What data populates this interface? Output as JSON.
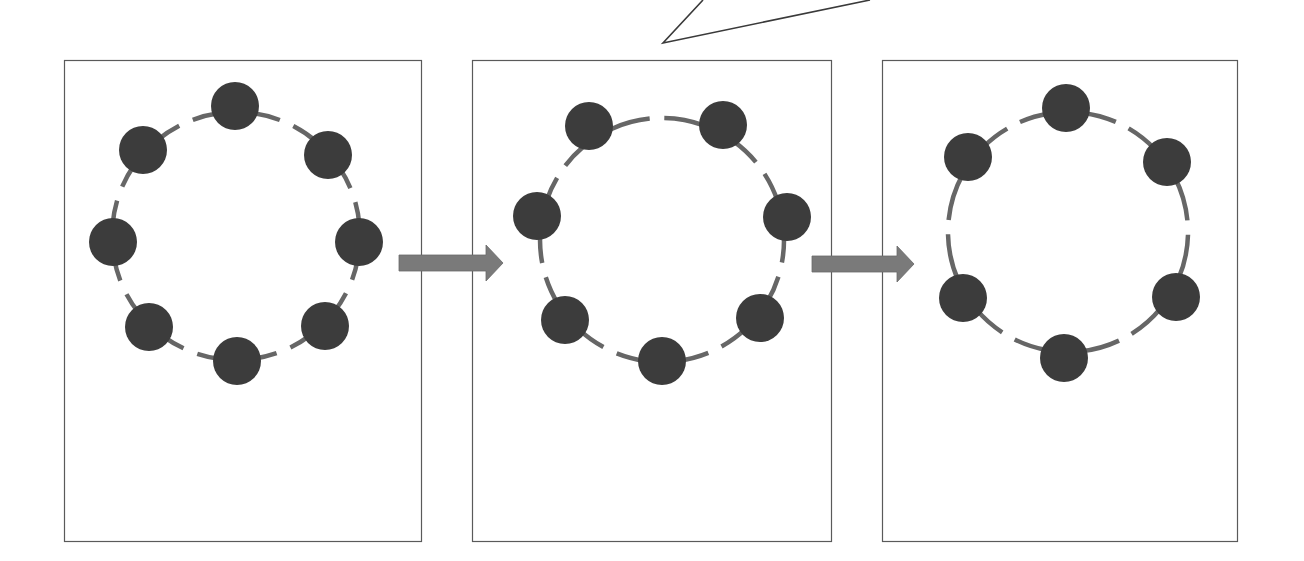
{
  "diagram": {
    "title": "",
    "colors": {
      "background": "#ffffff",
      "panel_border": "#5a5a5a",
      "bead_fill": "#3c3c3c",
      "ring_dash": "#666666",
      "arrow_fill": "#7a7a7a",
      "callout_stroke": "#3a3a3a"
    },
    "callout_pointer": {
      "tip": [
        663,
        43
      ],
      "left_end": [
        703,
        0
      ],
      "right_end": [
        870,
        0
      ]
    },
    "panels": [
      {
        "id": "panel-1",
        "bead_count": 8,
        "box": {
          "x": 64,
          "y": 60,
          "w": 357,
          "h": 481
        },
        "ring": {
          "cx": 236,
          "cy": 236,
          "r": 124
        },
        "beads": [
          [
            235,
            106
          ],
          [
            328,
            155
          ],
          [
            359,
            242
          ],
          [
            325,
            326
          ],
          [
            237,
            361
          ],
          [
            149,
            327
          ],
          [
            113,
            242
          ],
          [
            143,
            150
          ]
        ]
      },
      {
        "id": "panel-2",
        "bead_count": 7,
        "box": {
          "x": 472,
          "y": 60,
          "w": 359,
          "h": 481
        },
        "ring": {
          "cx": 662,
          "cy": 240,
          "r": 122
        },
        "beads": [
          [
            589,
            126
          ],
          [
            723,
            125
          ],
          [
            787,
            217
          ],
          [
            760,
            318
          ],
          [
            662,
            361
          ],
          [
            565,
            320
          ],
          [
            537,
            216
          ]
        ]
      },
      {
        "id": "panel-3",
        "bead_count": 6,
        "box": {
          "x": 882,
          "y": 60,
          "w": 355,
          "h": 481
        },
        "ring": {
          "cx": 1068,
          "cy": 232,
          "r": 120
        },
        "beads": [
          [
            1066,
            108
          ],
          [
            1167,
            162
          ],
          [
            1176,
            297
          ],
          [
            1064,
            358
          ],
          [
            963,
            298
          ],
          [
            968,
            157
          ]
        ]
      }
    ],
    "arrows": [
      {
        "id": "arrow-1",
        "from": "panel-1",
        "to": "panel-2",
        "x1": 399,
        "x2": 503,
        "y": 263
      },
      {
        "id": "arrow-2",
        "from": "panel-2",
        "to": "panel-3",
        "x1": 812,
        "x2": 914,
        "y": 264
      }
    ],
    "bead_radius": 24
  }
}
